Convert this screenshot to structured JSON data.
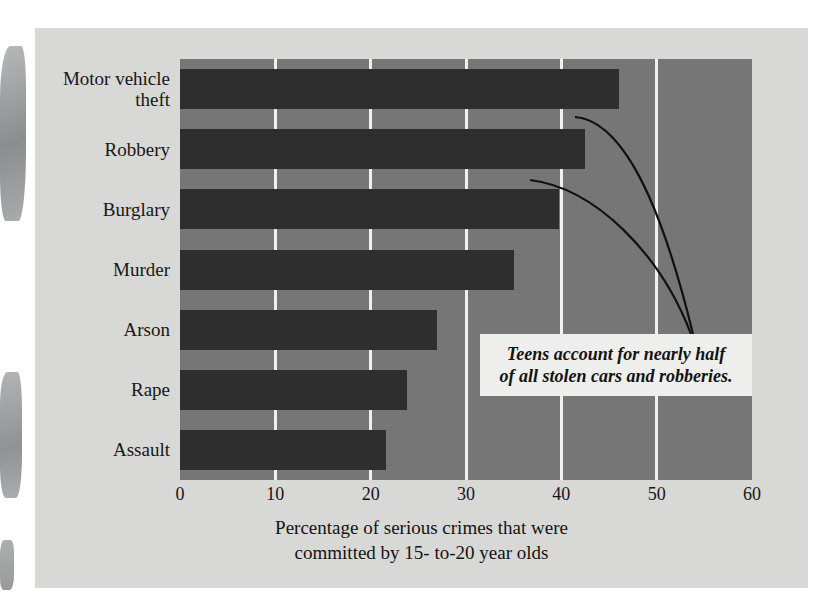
{
  "chart_data": {
    "type": "bar",
    "orientation": "horizontal",
    "title": "",
    "categories": [
      "Motor vehicle\ntheft",
      "Robbery",
      "Burglary",
      "Murder",
      "Arson",
      "Rape",
      "Assault"
    ],
    "values": [
      46,
      42.5,
      39.8,
      35,
      27,
      23.8,
      21.6
    ],
    "xlabel": "Percentage of serious crimes that were\ncommitted by 15- to-20 year olds",
    "ylabel": "",
    "xlim": [
      0,
      60
    ],
    "xticks": [
      "0",
      "10",
      "20",
      "30",
      "40",
      "50",
      "60"
    ],
    "grid": "vertical-white",
    "legend": "none",
    "annotations": [
      {
        "text": "Teens account for nearly half\nof all stolen cars and robberies.",
        "points_to": [
          "Motor vehicle theft",
          "Robbery"
        ]
      }
    ],
    "colors": {
      "bar": "#2e2e2e",
      "plot_background": "#767676",
      "card_background": "#d8d8d6",
      "gridline": "#f0f0ee",
      "callout_background": "#eeeeec",
      "text": "#141414"
    }
  }
}
